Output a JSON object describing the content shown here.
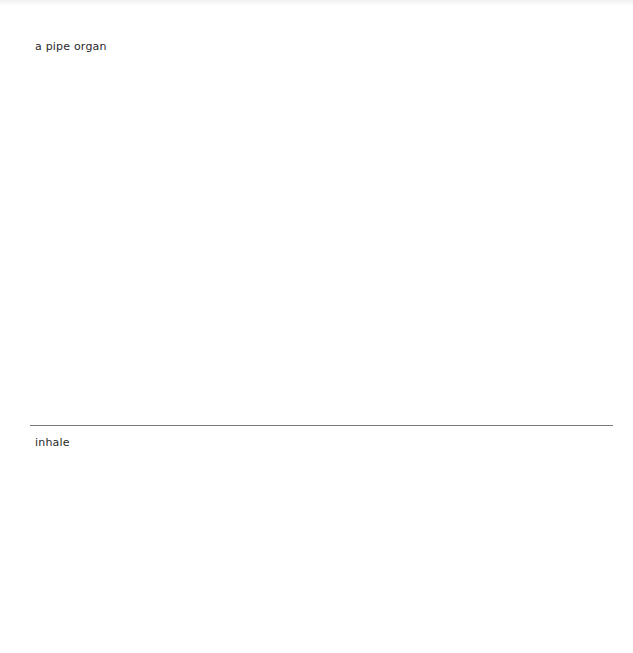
{
  "panels": [
    {
      "caption": "a pipe organ"
    },
    {
      "caption": "inhale"
    }
  ],
  "colors": {
    "background": "#ffffff",
    "text": "#2a2a2a",
    "divider": "#7a7a7a"
  }
}
